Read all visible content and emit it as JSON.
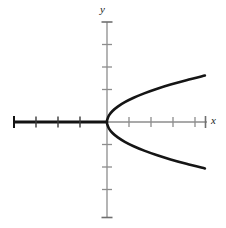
{
  "figure": {
    "width": 226,
    "height": 228,
    "background": "#ffffff"
  },
  "labels": {
    "x_axis": "x",
    "y_axis": "y"
  },
  "chart_data": {
    "type": "line",
    "title": "",
    "xlabel": "x",
    "ylabel": "y",
    "grid": false,
    "legend": false,
    "equation": "x = y^2",
    "xlim": [
      -4.3,
      4.5
    ],
    "ylim": [
      -4.4,
      4.5
    ],
    "x_ticks": [
      -4,
      -3,
      -2,
      -1,
      1,
      2,
      3,
      4
    ],
    "y_ticks": [
      -4,
      -3,
      -2,
      -1,
      1,
      2,
      3,
      4
    ],
    "x_tick_labels": [
      "",
      "",
      "",
      "",
      "",
      "",
      "",
      ""
    ],
    "y_tick_labels": [
      "",
      "",
      "",
      "",
      "",
      "",
      "",
      ""
    ],
    "series": [
      {
        "name": "x = y^2",
        "color": "#151515",
        "linewidth": 2.6,
        "x": [
          4.45,
          3.61,
          2.89,
          2.25,
          1.69,
          1.21,
          0.81,
          0.49,
          0.25,
          0.09,
          0.01,
          0.0,
          0.01,
          0.09,
          0.25,
          0.49,
          0.81,
          1.21,
          1.69,
          2.25,
          2.89,
          3.61,
          4.45
        ],
        "y": [
          2.11,
          1.9,
          1.7,
          1.5,
          1.3,
          1.1,
          0.9,
          0.7,
          0.5,
          0.3,
          0.1,
          0.0,
          -0.1,
          -0.3,
          -0.5,
          -0.7,
          -0.9,
          -1.1,
          -1.3,
          -1.5,
          -1.7,
          -1.9,
          -2.11
        ]
      }
    ]
  },
  "axes": {
    "x_axis_left_color": "#131313",
    "x_axis_right_color": "#8d8d8d",
    "y_axis_color": "#8d8d8d",
    "origin_x": 107,
    "origin_y": 122,
    "unit_px": 22
  }
}
